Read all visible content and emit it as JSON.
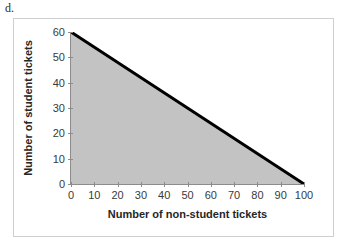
{
  "part_label": "d.",
  "chart_data": {
    "type": "line",
    "title": "",
    "xlabel": "Number of non-student tickets",
    "ylabel": "Number of student tickets",
    "xlim": [
      0,
      100
    ],
    "ylim": [
      0,
      60
    ],
    "xticks": [
      0,
      10,
      20,
      30,
      40,
      50,
      60,
      70,
      80,
      90,
      100
    ],
    "yticks": [
      0,
      10,
      20,
      30,
      40,
      50,
      60
    ],
    "grid": false,
    "legend": null,
    "series": [
      {
        "name": "constraint-boundary",
        "x": [
          0,
          100
        ],
        "values": [
          60,
          0
        ],
        "color": "#000000",
        "line_width": 3
      }
    ],
    "shaded_region": {
      "name": "feasible-region",
      "description": "region below the line and above the x-axis",
      "points": [
        [
          0,
          0
        ],
        [
          0,
          60
        ],
        [
          100,
          0
        ]
      ],
      "color": "#c3c3c3"
    }
  }
}
